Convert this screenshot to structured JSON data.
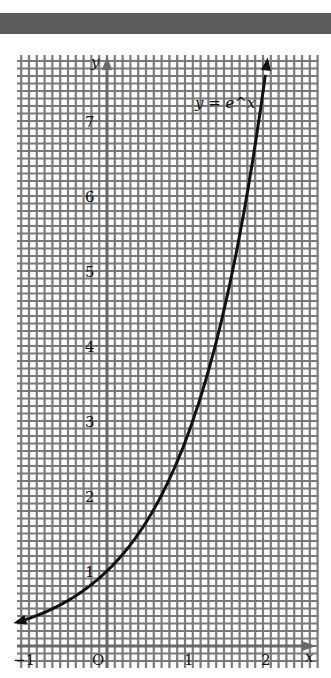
{
  "chart_data": {
    "type": "line",
    "title": "",
    "curve_label": "y = e^x",
    "function": "exp",
    "xlabel": "x",
    "ylabel": "y",
    "origin_label": "O",
    "xlim": [
      -1.15,
      2.65
    ],
    "ylim": [
      -0.3,
      7.9
    ],
    "xticks": [
      -1,
      1,
      2
    ],
    "xtick_labels": [
      "-1",
      "1",
      "2"
    ],
    "yticks": [
      1,
      2,
      3,
      4,
      5,
      6,
      7
    ],
    "ytick_labels": [
      "1",
      "2",
      "3",
      "4",
      "5",
      "6",
      "7"
    ],
    "grid": true,
    "grid_minor_step": 0.1,
    "x": [
      -1.15,
      -1.0,
      -0.5,
      0,
      0.5,
      1.0,
      1.5,
      2.0,
      2.06
    ],
    "y": [
      0.317,
      0.368,
      0.607,
      1.0,
      1.649,
      2.718,
      4.482,
      7.389,
      7.846
    ],
    "colors": {
      "curve": "#111111",
      "grid": "#7a7a7a",
      "axes": "#6a6a6a",
      "top_bar": "#5b5b5b"
    }
  }
}
